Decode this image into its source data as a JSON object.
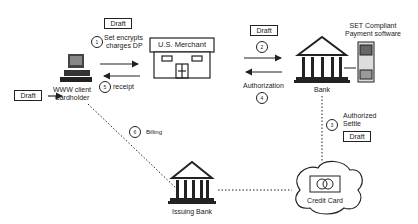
{
  "diagram": {
    "nodes": {
      "cardholder": {
        "label_line1": "WWW client",
        "label_line2": "Cardholder"
      },
      "merchant": {
        "label": "U.S. Merchant"
      },
      "bank": {
        "label": "Bank"
      },
      "payment_software": {
        "label_line1": "SET Compliant",
        "label_line2": "Payment software"
      },
      "issuing_bank": {
        "label": "Issuing Bank"
      },
      "credit_card": {
        "label": "Credit Card"
      }
    },
    "draft_label": "Draft",
    "steps": [
      {
        "num": "1",
        "label_line1": "Set encrypts",
        "label_line2": "charges DP"
      },
      {
        "num": "2",
        "label": ""
      },
      {
        "num": "3",
        "label_line1": "Authorized",
        "label_line2": "Settle"
      },
      {
        "num": "4",
        "label": "Authorization"
      },
      {
        "num": "5",
        "label": "receipt"
      },
      {
        "num": "6",
        "label": "Billing"
      }
    ]
  }
}
